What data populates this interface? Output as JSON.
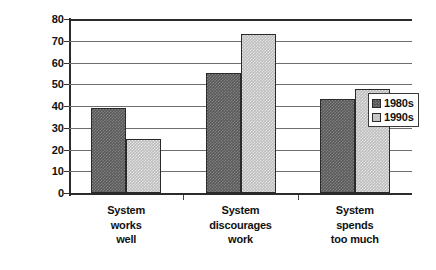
{
  "chart_data": {
    "type": "bar",
    "title": "",
    "xlabel": "",
    "ylabel": "Percent in agreement",
    "ylim": [
      0,
      80
    ],
    "ytick_step": 10,
    "yticks": [
      80,
      70,
      60,
      50,
      40,
      30,
      20,
      10,
      0
    ],
    "grid": true,
    "legend_position": "top-right-inside",
    "categories": [
      "System works well",
      "System discourages work",
      "System spends too much"
    ],
    "category_lines": [
      [
        "System",
        "works",
        "well"
      ],
      [
        "System",
        "discourages",
        "work"
      ],
      [
        "System",
        "spends",
        "too much"
      ]
    ],
    "series": [
      {
        "name": "1980s",
        "values": [
          39,
          55,
          43
        ],
        "color": "#595959"
      },
      {
        "name": "1990s",
        "values": [
          25,
          73,
          48
        ],
        "color": "#c6c6c6"
      }
    ]
  },
  "legend": {
    "entries": [
      {
        "label": "1980s"
      },
      {
        "label": "1990s"
      }
    ]
  }
}
